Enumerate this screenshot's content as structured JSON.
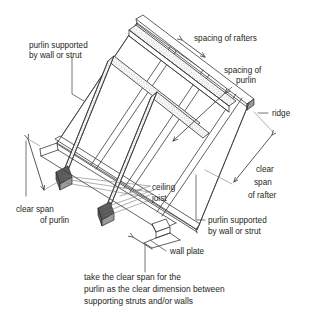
{
  "diagram": {
    "background_color": "#ffffff",
    "line_color": "#3a3a3a",
    "text_color": "#231f20"
  },
  "labels": {
    "purlin_supported_left": {
      "line1": "purlin supported",
      "line2": "by wall or strut"
    },
    "spacing_of_rafters": {
      "line1": "spacing of rafters"
    },
    "spacing_of_purlin": {
      "line1": "spacing of",
      "line2": "purlin"
    },
    "ridge": {
      "line1": "ridge"
    },
    "clear_span_of_rafter": {
      "line1": "clear",
      "line2": "span",
      "line3": "of rafter"
    },
    "ceiling_joist": {
      "line1": "ceiling",
      "line2": "joist"
    },
    "clear_span_of_purlin": {
      "line1": "clear span",
      "line2": "of purlin"
    },
    "purlin_supported_right": {
      "line1": "purlin supported",
      "line2": "by wall or strut"
    },
    "wall_plate": {
      "line1": "wall plate"
    },
    "caption": {
      "line1": "take the clear span for the",
      "line2": "purlin as the clear dimension between",
      "line3": "supporting struts and/or walls"
    }
  }
}
